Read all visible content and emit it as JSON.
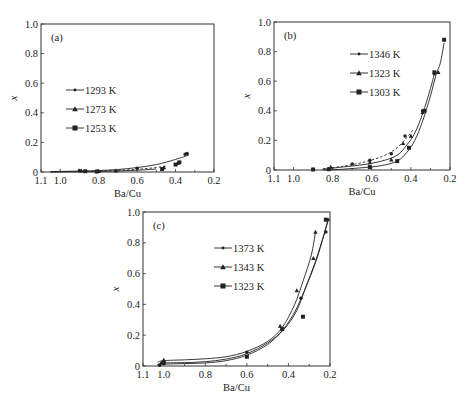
{
  "chart_data": [
    {
      "type": "scatter",
      "panel_label": "(a)",
      "xlabel": "Ba/Cu",
      "ylabel": "x",
      "xlim": [
        1.1,
        0.2
      ],
      "ylim": [
        0,
        1.0
      ],
      "x_ticks": [
        1.1,
        1.0,
        0.8,
        0.6,
        0.4,
        0.2
      ],
      "x_tick_labels": [
        "1.1",
        "1.0",
        "0.8",
        "0.6",
        "0.4",
        "0.2"
      ],
      "y_ticks": [
        0,
        0.2,
        0.4,
        0.6,
        0.8,
        1.0
      ],
      "y_tick_labels": [
        "0",
        "0.2",
        "0.4",
        "0.6",
        "0.8",
        "1.0"
      ],
      "pixel_box": {
        "left": 41,
        "right": 214,
        "top": 24,
        "bottom": 172
      },
      "legend": {
        "x": 84,
        "y": 90
      },
      "series": [
        {
          "name": "1293 K",
          "marker": "circle",
          "line": "solid",
          "points": [
            [
              0.9,
              0.01
            ],
            [
              0.81,
              0.005
            ],
            [
              0.6,
              0.025
            ],
            [
              0.35,
              0.12
            ],
            [
              0.34,
              0.125
            ]
          ],
          "curve": [
            [
              1.05,
              0.003
            ],
            [
              0.9,
              0.006
            ],
            [
              0.8,
              0.01
            ],
            [
              0.7,
              0.017
            ],
            [
              0.6,
              0.03
            ],
            [
              0.5,
              0.05
            ],
            [
              0.4,
              0.085
            ],
            [
              0.33,
              0.115
            ]
          ]
        },
        {
          "name": "1273 K",
          "marker": "triangle",
          "line": "dashed",
          "points": [
            [
              0.89,
              0.008
            ],
            [
              0.8,
              0.005
            ],
            [
              0.71,
              0.008
            ],
            [
              0.46,
              0.03
            ],
            [
              0.39,
              0.06
            ]
          ],
          "curve": [
            [
              1.05,
              0.002
            ],
            [
              0.9,
              0.004
            ],
            [
              0.8,
              0.007
            ],
            [
              0.7,
              0.011
            ],
            [
              0.6,
              0.018
            ],
            [
              0.5,
              0.03
            ],
            [
              0.45,
              0.04
            ]
          ]
        },
        {
          "name": "1253 K",
          "marker": "square",
          "line": "solid",
          "points": [
            [
              0.87,
              0.005
            ],
            [
              0.81,
              0.003
            ],
            [
              0.47,
              0.02
            ],
            [
              0.4,
              0.05
            ],
            [
              0.38,
              0.065
            ]
          ],
          "curve": [
            [
              1.05,
              0.0
            ],
            [
              0.9,
              0.002
            ],
            [
              0.8,
              0.004
            ],
            [
              0.7,
              0.007
            ],
            [
              0.6,
              0.012
            ],
            [
              0.5,
              0.02
            ]
          ]
        }
      ]
    },
    {
      "type": "scatter",
      "panel_label": "(b)",
      "xlabel": "Ba/Cu",
      "ylabel": "x",
      "xlim": [
        1.1,
        0.2
      ],
      "ylim": [
        0,
        1.0
      ],
      "x_ticks": [
        1.1,
        1.0,
        0.8,
        0.6,
        0.4,
        0.2
      ],
      "x_tick_labels": [
        "1.1",
        "1.0",
        "0.8",
        "0.6",
        "0.4",
        "0.2"
      ],
      "y_ticks": [
        0,
        0.2,
        0.4,
        0.6,
        0.8,
        1.0
      ],
      "y_tick_labels": [
        "0",
        "0.2",
        "0.4",
        "0.6",
        "0.8",
        "1.0"
      ],
      "pixel_box": {
        "left": 274,
        "right": 450,
        "top": 22,
        "bottom": 170
      },
      "legend": {
        "x": 368,
        "y": 54
      },
      "series": [
        {
          "name": "1346 K",
          "marker": "circle",
          "line": "dashed",
          "points": [
            [
              0.9,
              0.005
            ],
            [
              0.7,
              0.04
            ],
            [
              0.61,
              0.065
            ],
            [
              0.5,
              0.11
            ],
            [
              0.43,
              0.23
            ],
            [
              0.34,
              0.4
            ],
            [
              0.28,
              0.65
            ],
            [
              0.23,
              0.88
            ]
          ],
          "curve": [
            [
              0.85,
              0.008
            ],
            [
              0.75,
              0.025
            ],
            [
              0.65,
              0.05
            ],
            [
              0.55,
              0.09
            ],
            [
              0.48,
              0.14
            ],
            [
              0.42,
              0.22
            ],
            [
              0.39,
              0.27
            ]
          ]
        },
        {
          "name": "1323 K",
          "marker": "triangle",
          "line": "solid",
          "points": [
            [
              0.81,
              0.02
            ],
            [
              0.61,
              0.05
            ],
            [
              0.5,
              0.07
            ],
            [
              0.44,
              0.18
            ],
            [
              0.4,
              0.23
            ],
            [
              0.34,
              0.39
            ],
            [
              0.26,
              0.66
            ]
          ],
          "curve": [
            [
              0.85,
              0.005
            ],
            [
              0.75,
              0.02
            ],
            [
              0.65,
              0.035
            ],
            [
              0.55,
              0.06
            ],
            [
              0.47,
              0.1
            ],
            [
              0.42,
              0.17
            ],
            [
              0.38,
              0.25
            ],
            [
              0.34,
              0.38
            ],
            [
              0.3,
              0.55
            ],
            [
              0.28,
              0.65
            ]
          ]
        },
        {
          "name": "1303 K",
          "marker": "square",
          "line": "solid",
          "points": [
            [
              0.9,
              0.003
            ],
            [
              0.82,
              0.005
            ],
            [
              0.61,
              0.02
            ],
            [
              0.47,
              0.06
            ],
            [
              0.41,
              0.15
            ],
            [
              0.33,
              0.4
            ],
            [
              0.28,
              0.66
            ],
            [
              0.23,
              0.88
            ]
          ],
          "curve": [
            [
              0.85,
              0.0
            ],
            [
              0.75,
              0.005
            ],
            [
              0.65,
              0.015
            ],
            [
              0.55,
              0.03
            ],
            [
              0.47,
              0.06
            ],
            [
              0.42,
              0.12
            ],
            [
              0.38,
              0.2
            ],
            [
              0.34,
              0.33
            ],
            [
              0.3,
              0.5
            ],
            [
              0.27,
              0.65
            ],
            [
              0.25,
              0.72
            ],
            [
              0.23,
              0.86
            ]
          ]
        }
      ]
    },
    {
      "type": "scatter",
      "panel_label": "(c)",
      "xlabel": "Ba/Cu",
      "ylabel": "x",
      "xlim": [
        1.1,
        0.2
      ],
      "ylim": [
        0,
        1.0
      ],
      "x_ticks": [
        1.1,
        1.0,
        0.8,
        0.6,
        0.4,
        0.2
      ],
      "x_tick_labels": [
        "1.1",
        "1.0",
        "0.8",
        "0.6",
        "0.4",
        "0.2"
      ],
      "y_ticks": [
        0,
        0.2,
        0.4,
        0.6,
        0.8,
        1.0
      ],
      "y_tick_labels": [
        "0",
        "0.2",
        "0.4",
        "0.6",
        "0.8",
        "1.0"
      ],
      "pixel_box": {
        "left": 143,
        "right": 330,
        "top": 212,
        "bottom": 366
      },
      "legend": {
        "x": 232,
        "y": 248
      },
      "series": [
        {
          "name": "1373 K",
          "marker": "circle",
          "line": "solid",
          "points": [
            [
              1.02,
              0.005
            ],
            [
              1.01,
              0.02
            ],
            [
              0.6,
              0.09
            ],
            [
              0.34,
              0.44
            ],
            [
              0.22,
              0.87
            ],
            [
              0.21,
              0.95
            ]
          ],
          "curve": [
            [
              1.03,
              0.01
            ],
            [
              1.0,
              0.02
            ],
            [
              0.9,
              0.022
            ],
            [
              0.8,
              0.028
            ],
            [
              0.7,
              0.045
            ],
            [
              0.6,
              0.08
            ],
            [
              0.5,
              0.15
            ],
            [
              0.42,
              0.24
            ],
            [
              0.36,
              0.36
            ],
            [
              0.32,
              0.5
            ],
            [
              0.27,
              0.68
            ],
            [
              0.23,
              0.85
            ],
            [
              0.21,
              0.95
            ]
          ]
        },
        {
          "name": "1343 K",
          "marker": "triangle",
          "line": "solid",
          "points": [
            [
              1.0,
              0.04
            ],
            [
              0.44,
              0.26
            ],
            [
              0.36,
              0.49
            ],
            [
              0.28,
              0.7
            ],
            [
              0.27,
              0.87
            ]
          ],
          "curve": [
            [
              1.03,
              0.025
            ],
            [
              1.0,
              0.035
            ],
            [
              0.9,
              0.04
            ],
            [
              0.8,
              0.047
            ],
            [
              0.7,
              0.06
            ],
            [
              0.6,
              0.095
            ],
            [
              0.5,
              0.16
            ],
            [
              0.43,
              0.25
            ],
            [
              0.37,
              0.4
            ],
            [
              0.33,
              0.55
            ],
            [
              0.29,
              0.72
            ],
            [
              0.27,
              0.87
            ]
          ]
        },
        {
          "name": "1323 K",
          "marker": "square",
          "line": "solid",
          "points": [
            [
              1.0,
              0.02
            ],
            [
              0.6,
              0.06
            ],
            [
              0.43,
              0.24
            ],
            [
              0.33,
              0.32
            ],
            [
              0.22,
              0.95
            ]
          ],
          "curve": [
            [
              1.03,
              0.008
            ],
            [
              1.0,
              0.012
            ],
            [
              0.9,
              0.016
            ],
            [
              0.8,
              0.02
            ],
            [
              0.7,
              0.035
            ],
            [
              0.6,
              0.07
            ],
            [
              0.5,
              0.14
            ],
            [
              0.43,
              0.23
            ],
            [
              0.37,
              0.35
            ],
            [
              0.32,
              0.5
            ],
            [
              0.27,
              0.67
            ],
            [
              0.24,
              0.8
            ],
            [
              0.21,
              0.94
            ]
          ]
        }
      ]
    }
  ]
}
